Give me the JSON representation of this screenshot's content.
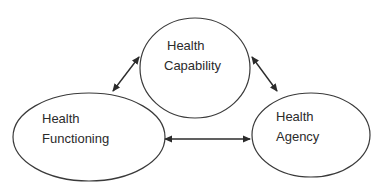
{
  "diagram": {
    "type": "relationship-triangle",
    "nodes": [
      {
        "id": "capability",
        "line1": "Health",
        "line2": "Capability",
        "shape": "ellipse"
      },
      {
        "id": "functioning",
        "line1": "Health",
        "line2": "Functioning",
        "shape": "ellipse"
      },
      {
        "id": "agency",
        "line1": "Health",
        "line2": "Agency",
        "shape": "ellipse"
      }
    ],
    "edges": [
      {
        "from": "functioning",
        "to": "capability",
        "direction": "bidirectional"
      },
      {
        "from": "capability",
        "to": "agency",
        "direction": "bidirectional"
      },
      {
        "from": "functioning",
        "to": "agency",
        "direction": "bidirectional"
      }
    ],
    "colors": {
      "stroke": "#3a3a3a",
      "text": "#2b2b2b",
      "background": "#ffffff"
    }
  }
}
